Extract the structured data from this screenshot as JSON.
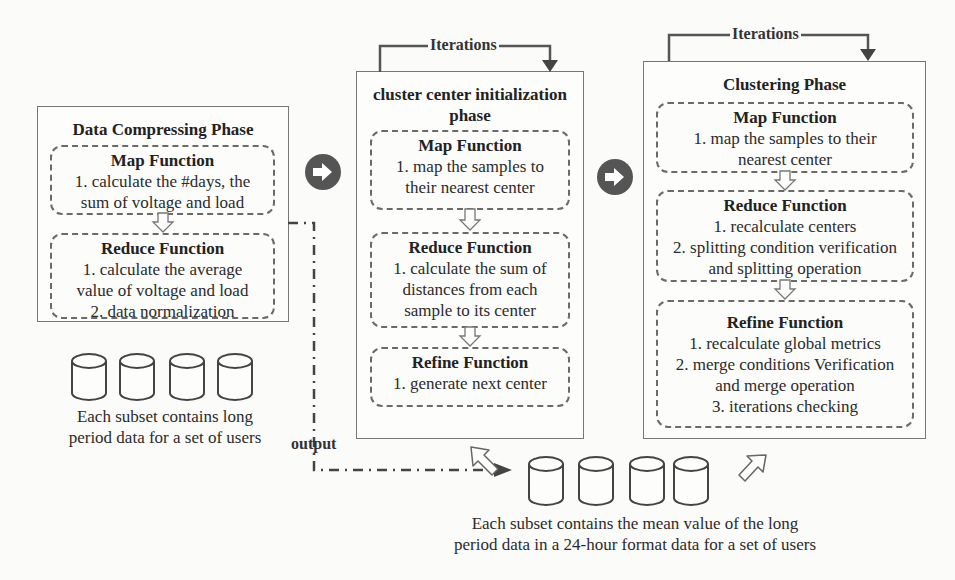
{
  "phases": [
    {
      "title": "Data Compressing Phase",
      "functions": [
        {
          "title": "Map Function",
          "lines": [
            "1. calculate the #days, the",
            "sum of voltage and load"
          ]
        },
        {
          "title": "Reduce Function",
          "lines": [
            "1. calculate the average",
            "value of voltage and load",
            "2. data normalization"
          ]
        }
      ]
    },
    {
      "title_lines": [
        "cluster center initialization",
        "phase"
      ],
      "iteration_label": "Iterations",
      "functions": [
        {
          "title": "Map Function",
          "lines": [
            "1. map the samples to",
            "their nearest center"
          ]
        },
        {
          "title": "Reduce Function",
          "lines": [
            "1. calculate the sum of",
            "distances from each",
            "sample to its center"
          ]
        },
        {
          "title": "Refine Function",
          "lines": [
            "1. generate next center"
          ]
        }
      ]
    },
    {
      "title": "Clustering Phase",
      "iteration_label": "Iterations",
      "functions": [
        {
          "title": "Map Function",
          "lines": [
            "1. map the samples to their",
            "nearest center"
          ]
        },
        {
          "title": "Reduce Function",
          "lines": [
            "1. recalculate centers",
            "2. splitting condition verification",
            "and splitting operation"
          ]
        },
        {
          "title": "Refine Function",
          "lines": [
            "1. recalculate global metrics",
            "2. merge conditions Verification",
            "and merge operation",
            "3. iterations checking"
          ]
        }
      ]
    }
  ],
  "datasets": {
    "input_caption": [
      "Each subset contains long",
      "period data for a set of users"
    ],
    "output_caption": [
      "Each subset contains the mean value of the long",
      "period data in a 24-hour format data for a set of users"
    ],
    "cylinder_count": 4
  },
  "connectors": {
    "output_label": "output",
    "next_icon": "circle-arrow-right-icon"
  },
  "colors": {
    "border": "#777777",
    "dashed": "#6a6a6a",
    "circle_arrow": "#555555",
    "background": "#fbfbf9"
  }
}
